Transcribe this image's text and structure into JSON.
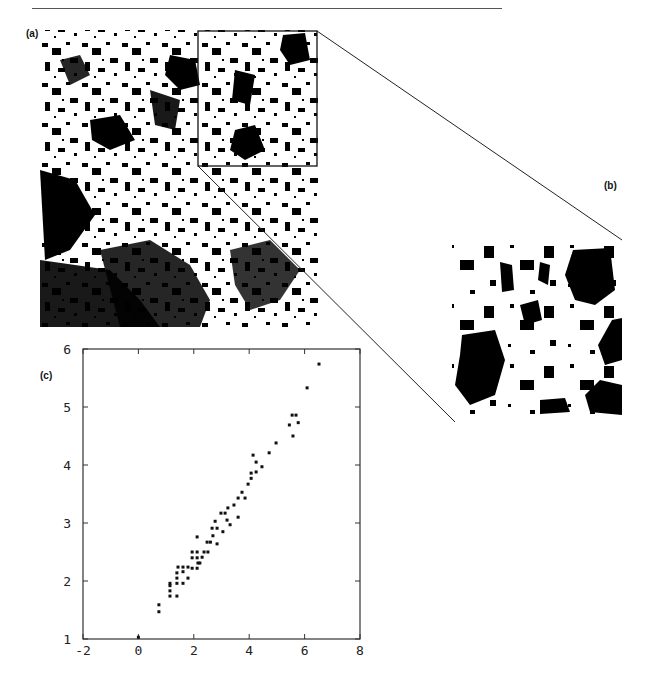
{
  "figure": {
    "panels": [
      {
        "id": "a",
        "label": "(a)",
        "description": "binary black/white texture map (full view)"
      },
      {
        "id": "b",
        "label": "(b)",
        "description": "magnified inset of boxed region of (a)"
      },
      {
        "id": "c",
        "label": "(c)",
        "description": "scatter plot"
      }
    ],
    "inset_box": {
      "x": 198,
      "y": 31,
      "w": 119,
      "h": 135
    }
  },
  "chart_data": {
    "type": "scatter",
    "title": "",
    "xlabel": "",
    "ylabel": "",
    "xlim": [
      -2,
      8
    ],
    "ylim": [
      1,
      6
    ],
    "x_ticks": [
      "-2",
      "0",
      "2",
      "4",
      "6",
      "8"
    ],
    "y_ticks": [
      "1",
      "2",
      "3",
      "4",
      "5",
      "6"
    ],
    "grid": false,
    "legend": null,
    "points": [
      [
        0.0,
        1.03
      ],
      [
        0.74,
        1.47
      ],
      [
        0.74,
        1.59
      ],
      [
        1.14,
        1.74
      ],
      [
        1.39,
        1.74
      ],
      [
        1.14,
        1.83
      ],
      [
        1.14,
        1.96
      ],
      [
        1.14,
        1.92
      ],
      [
        1.39,
        1.96
      ],
      [
        1.61,
        1.96
      ],
      [
        1.39,
        2.05
      ],
      [
        1.79,
        2.05
      ],
      [
        1.39,
        2.14
      ],
      [
        1.61,
        2.16
      ],
      [
        1.43,
        2.24
      ],
      [
        1.61,
        2.24
      ],
      [
        1.79,
        2.24
      ],
      [
        1.94,
        2.22
      ],
      [
        2.12,
        2.22
      ],
      [
        2.15,
        2.31
      ],
      [
        2.22,
        2.31
      ],
      [
        1.94,
        2.4
      ],
      [
        2.12,
        2.4
      ],
      [
        2.3,
        2.41
      ],
      [
        1.94,
        2.5
      ],
      [
        2.12,
        2.5
      ],
      [
        2.37,
        2.5
      ],
      [
        2.51,
        2.5
      ],
      [
        2.48,
        2.67
      ],
      [
        2.6,
        2.67
      ],
      [
        2.84,
        2.64
      ],
      [
        2.12,
        2.76
      ],
      [
        2.69,
        2.78
      ],
      [
        3.05,
        2.85
      ],
      [
        2.66,
        2.91
      ],
      [
        2.84,
        2.91
      ],
      [
        2.77,
        3.03
      ],
      [
        3.31,
        2.97
      ],
      [
        3.2,
        3.05
      ],
      [
        3.6,
        3.1
      ],
      [
        2.98,
        3.17
      ],
      [
        3.13,
        3.17
      ],
      [
        3.23,
        3.26
      ],
      [
        3.45,
        3.31
      ],
      [
        3.6,
        3.43
      ],
      [
        3.85,
        3.43
      ],
      [
        3.74,
        3.53
      ],
      [
        3.96,
        3.67
      ],
      [
        4.07,
        3.77
      ],
      [
        4.07,
        3.86
      ],
      [
        4.25,
        3.88
      ],
      [
        4.46,
        3.97
      ],
      [
        4.25,
        4.05
      ],
      [
        4.14,
        4.17
      ],
      [
        4.72,
        4.21
      ],
      [
        4.97,
        4.38
      ],
      [
        5.58,
        4.5
      ],
      [
        5.45,
        4.69
      ],
      [
        5.77,
        4.73
      ],
      [
        5.55,
        4.86
      ],
      [
        5.69,
        4.86
      ],
      [
        6.09,
        5.33
      ],
      [
        6.52,
        5.74
      ]
    ],
    "plot_area_px": {
      "left": 83,
      "right": 360,
      "top": 349,
      "bottom": 639
    },
    "marker_color": "#111111"
  }
}
